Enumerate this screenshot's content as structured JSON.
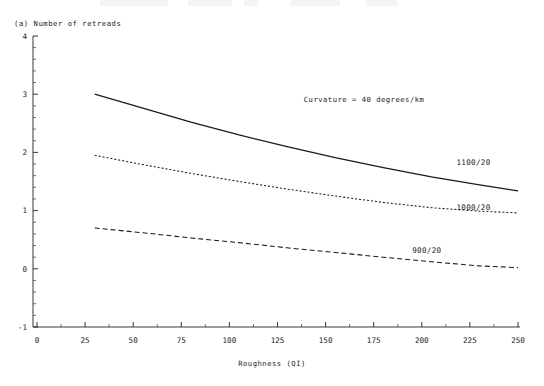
{
  "chart_data": {
    "type": "line",
    "title": "(a) Number of retreads",
    "xlabel": "Roughness (QI)",
    "ylabel": "Number of retreads",
    "xlim": [
      0,
      250
    ],
    "ylim": [
      -1,
      4
    ],
    "xticks": [
      0,
      25,
      50,
      75,
      100,
      125,
      150,
      175,
      200,
      225,
      250
    ],
    "xtick_labels": [
      "0",
      "25",
      "50",
      "75",
      "100",
      "125",
      "150",
      "175",
      "200",
      "225",
      "250"
    ],
    "yticks": [
      -1,
      0,
      1,
      2,
      3,
      4
    ],
    "ytick_labels": [
      "-1",
      "0",
      "1",
      "2",
      "3",
      "4"
    ],
    "minor_ticks": true,
    "grid": false,
    "legend_position": "inline-end-of-line",
    "annotations": [
      {
        "text": "Curvature = 40 degrees/km",
        "x": 170,
        "y": 2.9
      }
    ],
    "series": [
      {
        "name": "1100/20",
        "style": "solid",
        "label_x": 218,
        "label_y": 1.82,
        "x": [
          30,
          55,
          80,
          105,
          130,
          155,
          180,
          205,
          230,
          250
        ],
        "y": [
          3.0,
          2.76,
          2.52,
          2.3,
          2.1,
          1.91,
          1.74,
          1.58,
          1.44,
          1.34
        ]
      },
      {
        "name": "1000/20",
        "style": "dotted",
        "label_x": 218,
        "label_y": 1.05,
        "x": [
          30,
          55,
          80,
          105,
          130,
          155,
          180,
          205,
          230,
          250
        ],
        "y": [
          1.95,
          1.79,
          1.64,
          1.5,
          1.37,
          1.25,
          1.14,
          1.05,
          0.99,
          0.96
        ]
      },
      {
        "name": "900/20",
        "style": "dashed",
        "label_x": 195,
        "label_y": 0.3,
        "x": [
          30,
          55,
          80,
          105,
          130,
          155,
          180,
          205,
          230,
          250
        ],
        "y": [
          0.7,
          0.62,
          0.53,
          0.45,
          0.36,
          0.28,
          0.2,
          0.12,
          0.05,
          0.02
        ]
      }
    ]
  }
}
